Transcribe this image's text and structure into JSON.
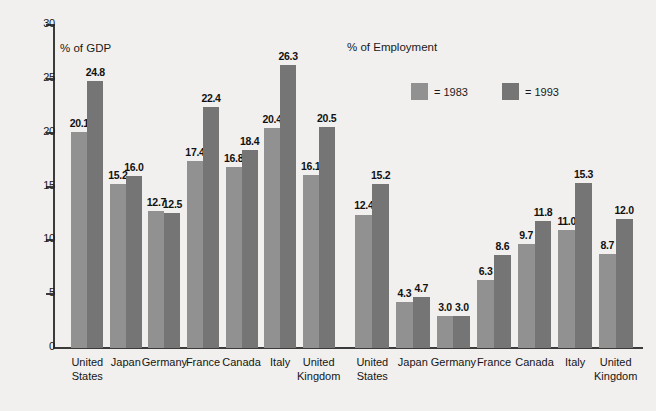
{
  "chart_data": {
    "type": "bar",
    "title": "",
    "panels": [
      {
        "name": "gdp",
        "title": "% of GDP",
        "categories": [
          "United States",
          "Japan",
          "Germany",
          "France",
          "Canada",
          "Italy",
          "United Kingdom"
        ],
        "series": [
          {
            "name": "1983",
            "values": [
              20.1,
              15.2,
              12.7,
              17.4,
              16.8,
              20.4,
              16.1
            ]
          },
          {
            "name": "1993",
            "values": [
              24.8,
              16.0,
              12.5,
              22.4,
              18.4,
              26.3,
              20.5
            ]
          }
        ]
      },
      {
        "name": "employment",
        "title": "% of Employment",
        "categories": [
          "United States",
          "Japan",
          "Germany",
          "France",
          "Canada",
          "Italy",
          "United Kingdom"
        ],
        "series": [
          {
            "name": "1983",
            "values": [
              12.4,
              4.3,
              3.0,
              6.3,
              9.7,
              11.0,
              8.7
            ]
          },
          {
            "name": "1993",
            "values": [
              15.2,
              4.7,
              3.0,
              8.6,
              11.8,
              15.3,
              12.0
            ]
          }
        ]
      }
    ],
    "yticks": [
      0,
      5,
      10,
      15,
      20,
      25,
      30
    ],
    "ylim": [
      0,
      30
    ],
    "ylabel": "",
    "xlabel": "",
    "grid": false,
    "legend": {
      "position": "top-center-right",
      "entries": [
        {
          "label": "= 1983",
          "color": "#919191"
        },
        {
          "label": "= 1993",
          "color": "#757575"
        }
      ]
    },
    "colors": {
      "series_1983": "#919191",
      "series_1993": "#757575",
      "background": "#f1f0ee",
      "axis": "#3b3b3b",
      "text": "#151515"
    },
    "value_label_format": "one-decimal"
  }
}
